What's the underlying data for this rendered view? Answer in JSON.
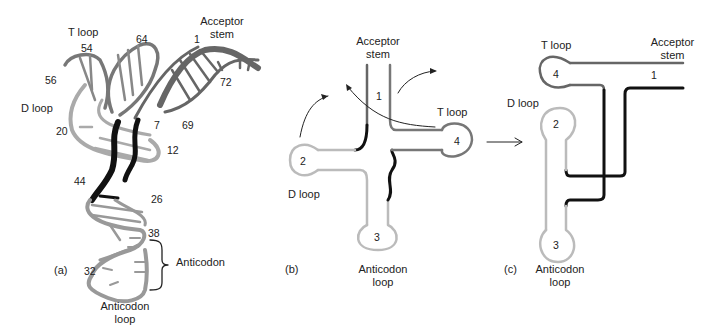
{
  "panels": {
    "a": {
      "tag": "(a)",
      "labels": {
        "t_loop": "T loop",
        "acceptor_stem_1": "Acceptor",
        "acceptor_stem_2": "stem",
        "d_loop": "D loop",
        "anticodon": "Anticodon",
        "anticodon_loop_1": "Anticodon",
        "anticodon_loop_2": "loop"
      },
      "numbers": [
        "54",
        "64",
        "1",
        "56",
        "72",
        "20",
        "7",
        "69",
        "12",
        "44",
        "26",
        "38",
        "32"
      ]
    },
    "b": {
      "tag": "(b)",
      "labels": {
        "acceptor_stem_1": "Acceptor",
        "acceptor_stem_2": "stem",
        "t_loop": "T loop",
        "d_loop": "D loop",
        "anticodon_loop_1": "Anticodon",
        "anticodon_loop_2": "loop"
      },
      "numbers": [
        "1",
        "2",
        "3",
        "4"
      ]
    },
    "c": {
      "tag": "(c)",
      "labels": {
        "t_loop": "T loop",
        "acceptor_stem_1": "Acceptor",
        "acceptor_stem_2": "stem",
        "d_loop": "D loop",
        "anticodon_loop_1": "Anticodon",
        "anticodon_loop_2": "loop"
      },
      "numbers": [
        "4",
        "1",
        "2",
        "3"
      ]
    }
  },
  "colors": {
    "dark_gray": "#666666",
    "mid_gray": "#8a8a8a",
    "light_gray": "#bdbdbd",
    "black": "#111111"
  }
}
